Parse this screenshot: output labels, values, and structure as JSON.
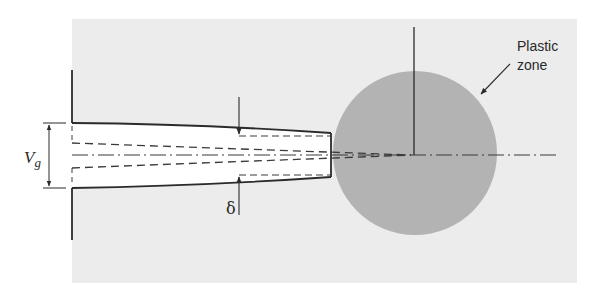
{
  "figure": {
    "labels": {
      "plastic_zone_line1": "Plastic",
      "plastic_zone_line2": "zone",
      "gap_opening_symbol": "V",
      "gap_opening_subscript": "g",
      "ctod_symbol": "δ"
    },
    "colors": {
      "background_material": "#ececec",
      "plastic_zone": "#b3b3b3",
      "crack_interior": "#ffffff",
      "line": "#2b2b2b"
    }
  }
}
